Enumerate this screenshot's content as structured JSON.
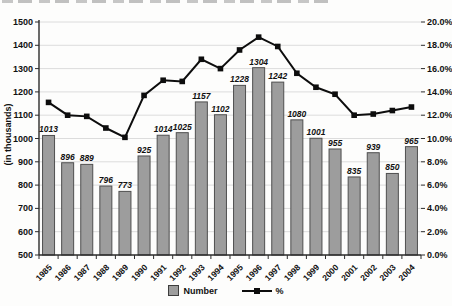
{
  "chart_data": {
    "type": "bar",
    "subtype": "bar-line-combo",
    "categories": [
      "1985",
      "1986",
      "1987",
      "1988",
      "1989",
      "1990",
      "1991",
      "1992",
      "1993",
      "1994",
      "1995",
      "1996",
      "1997",
      "1998",
      "1999",
      "2000",
      "2001",
      "2002",
      "2003",
      "2004"
    ],
    "series": [
      {
        "name": "Number",
        "type": "bar",
        "axis": "left",
        "values": [
          1013,
          896,
          889,
          796,
          773,
          925,
          1014,
          1025,
          1157,
          1102,
          1228,
          1304,
          1242,
          1080,
          1001,
          955,
          835,
          939,
          850,
          965
        ]
      },
      {
        "name": "%",
        "type": "line",
        "axis": "right",
        "values": [
          13.1,
          12.0,
          11.9,
          10.9,
          10.1,
          13.7,
          15.0,
          14.9,
          16.8,
          16.0,
          17.6,
          18.7,
          17.9,
          15.6,
          14.4,
          13.8,
          12.0,
          12.1,
          12.4,
          12.7
        ]
      }
    ],
    "left_axis": {
      "label": "(in thousands)",
      "min": 500,
      "max": 1500,
      "step": 100,
      "tick_labels": [
        "1500",
        "1400",
        "1300",
        "1200",
        "1100",
        "1000",
        "900",
        "800",
        "700",
        "600",
        "500"
      ]
    },
    "right_axis": {
      "min": 0,
      "max": 20,
      "step": 2,
      "tick_labels": [
        "20.0%",
        "18.0%",
        "16.0%",
        "14.0%",
        "12.0%",
        "10.0%",
        "8.0%",
        "6.0%",
        "4.0%",
        "2.0%",
        "0.0%"
      ]
    },
    "grid": true,
    "bar_value_labels": true,
    "legend_position": "bottom"
  },
  "legend": {
    "items": [
      {
        "label": "Number"
      },
      {
        "label": "%"
      }
    ]
  },
  "colors": {
    "bar_fill": "#9d9d9d",
    "bar_border": "#4f4f4f",
    "line": "#0d0d0d",
    "grid": "#dcdcdc",
    "axis": "#2b2b2b",
    "text": "#111111",
    "background": "#fdfdfc"
  }
}
